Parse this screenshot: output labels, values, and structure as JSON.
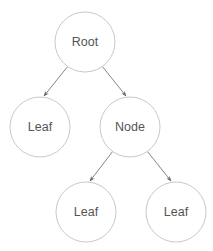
{
  "diagram": {
    "type": "tree",
    "colors": {
      "node_stroke": "#c8c8c8",
      "edge": "#777777",
      "label": "#555555",
      "background": "#ffffff"
    },
    "nodes": [
      {
        "id": "root",
        "label": "Root",
        "cx": 85,
        "cy": 42,
        "r": 30
      },
      {
        "id": "leaf1",
        "label": "Leaf",
        "cx": 40,
        "cy": 127,
        "r": 30
      },
      {
        "id": "node",
        "label": "Node",
        "cx": 130,
        "cy": 127,
        "r": 30
      },
      {
        "id": "leaf2",
        "label": "Leaf",
        "cx": 86,
        "cy": 212,
        "r": 30
      },
      {
        "id": "leaf3",
        "label": "Leaf",
        "cx": 176,
        "cy": 212,
        "r": 30
      }
    ],
    "edges": [
      {
        "from": "root",
        "to": "leaf1"
      },
      {
        "from": "root",
        "to": "node"
      },
      {
        "from": "node",
        "to": "leaf2"
      },
      {
        "from": "node",
        "to": "leaf3"
      }
    ]
  }
}
